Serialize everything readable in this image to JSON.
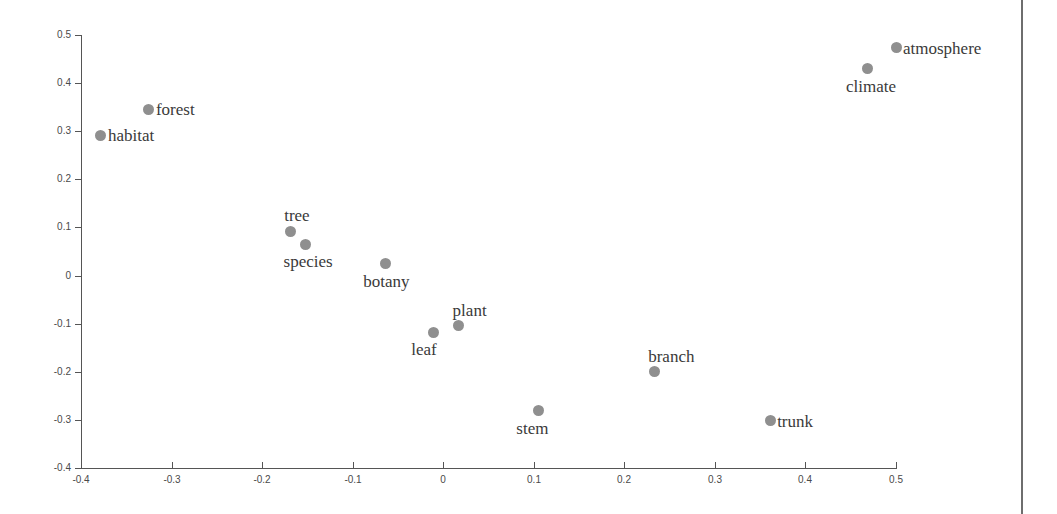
{
  "chart_data": {
    "type": "scatter",
    "title": "",
    "subtitle": "",
    "xlabel": "",
    "ylabel": "",
    "xlim": [
      -0.4,
      0.5
    ],
    "ylim": [
      -0.4,
      0.5
    ],
    "xticks": [
      "-0.4",
      "-0.3",
      "-0.2",
      "-0.1",
      "0",
      "0.1",
      "0.2",
      "0.3",
      "0.4",
      "0.5"
    ],
    "xtick_values": [
      -0.4,
      -0.3,
      -0.2,
      -0.1,
      0,
      0.1,
      0.2,
      0.3,
      0.4,
      0.5
    ],
    "yticks": [
      "0.5",
      "0.4",
      "0.3",
      "0.2",
      "0.1",
      "0",
      "-0.1",
      "-0.2",
      "-0.3",
      "-0.4"
    ],
    "ytick_values": [
      0.5,
      0.4,
      0.3,
      0.2,
      0.1,
      0,
      -0.1,
      -0.2,
      -0.3,
      -0.4
    ],
    "grid": false,
    "legend": "none",
    "marker_color": "#8f8f8f",
    "label_color": "#3a3a3a",
    "axis_color": "#555555",
    "points": [
      {
        "label": "habitat",
        "x": -0.378,
        "y": 0.292,
        "label_pos": "right"
      },
      {
        "label": "forest",
        "x": -0.325,
        "y": 0.346,
        "label_pos": "right"
      },
      {
        "label": "tree",
        "x": -0.169,
        "y": 0.092,
        "label_pos": "above"
      },
      {
        "label": "species",
        "x": -0.152,
        "y": 0.065,
        "label_pos": "below"
      },
      {
        "label": "botany",
        "x": -0.064,
        "y": 0.025,
        "label_pos": "below"
      },
      {
        "label": "plant",
        "x": 0.017,
        "y": -0.104,
        "label_pos": "above"
      },
      {
        "label": "leaf",
        "x": -0.011,
        "y": -0.118,
        "label_pos": "below"
      },
      {
        "label": "stem",
        "x": 0.105,
        "y": -0.281,
        "label_pos": "below"
      },
      {
        "label": "branch",
        "x": 0.233,
        "y": -0.2,
        "label_pos": "above"
      },
      {
        "label": "trunk",
        "x": 0.361,
        "y": -0.302,
        "label_pos": "right"
      },
      {
        "label": "climate",
        "x": 0.469,
        "y": 0.43,
        "label_pos": "below"
      },
      {
        "label": "atmosphere",
        "x": 0.5,
        "y": 0.474,
        "label_pos": "right"
      }
    ]
  },
  "page": {
    "edge_line_color": "#6e6e6e",
    "background": "#ffffff"
  }
}
